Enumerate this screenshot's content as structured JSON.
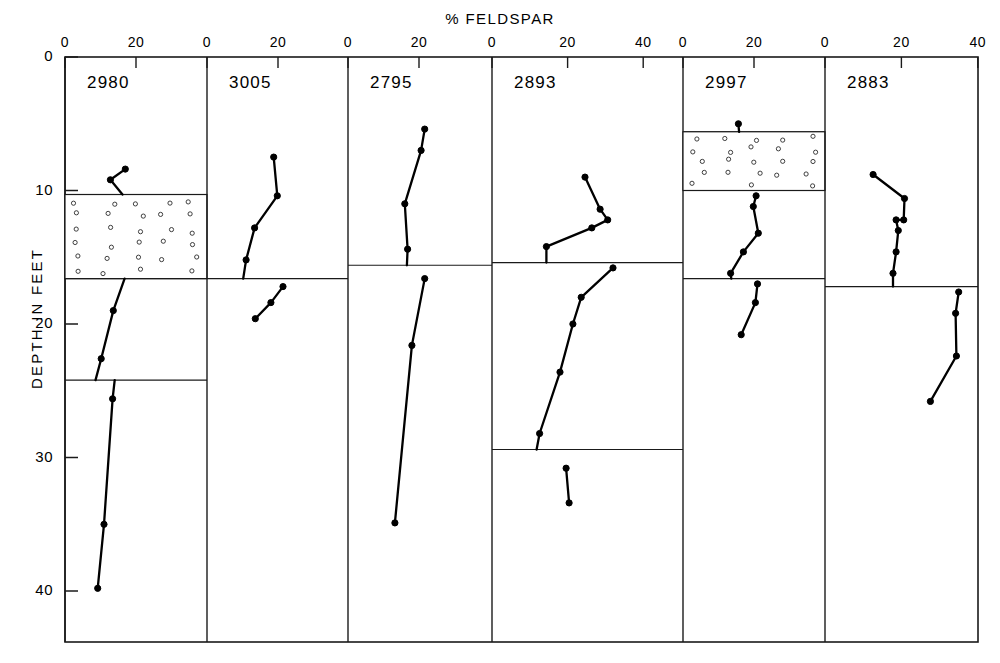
{
  "figure": {
    "title": "% FELDSPAR",
    "y_axis_label": "DEPTH IN FEET",
    "y_ticks": [
      "0",
      "10",
      "20",
      "30",
      "40"
    ],
    "line_color": "#000000",
    "axis_color": "#1a1a1a",
    "background": "#ffffff"
  },
  "chart_data": {
    "type": "line",
    "title": "% FELDSPAR",
    "xlabel": "% FELDSPAR",
    "ylabel": "DEPTH IN FEET",
    "ylim": [
      0,
      44
    ],
    "y_inverted": true,
    "grid": false,
    "legend": "none",
    "note": "Six stratigraphic borehole columns; x = percent feldspar, y = depth in feet (increasing downward). Stippled (small-circle) blocks denote a gravel/coarse lithologic interval; thin horizontal rules are bed-contact boundaries.",
    "panels": [
      {
        "name": "2980",
        "xlim": [
          0,
          30
        ],
        "x_ticks": [
          0,
          20
        ],
        "x_tick_labels": [
          "0",
          "20"
        ],
        "lithology_bands": [
          {
            "pattern": "circles",
            "top_depth": 10.3,
            "bottom_depth": 16.6
          }
        ],
        "boundaries": [
          10.3,
          16.6,
          24.2
        ],
        "series": [
          {
            "name": "upper",
            "points": [
              {
                "depth": 8.4,
                "value": 17.0
              },
              {
                "depth": 9.2,
                "value": 12.8
              },
              {
                "depth": 10.3,
                "value": 16.2
              }
            ]
          },
          {
            "name": "middle",
            "points": [
              {
                "depth": 16.6,
                "value": 16.8
              },
              {
                "depth": 19.0,
                "value": 13.6
              },
              {
                "depth": 22.6,
                "value": 10.2
              },
              {
                "depth": 24.2,
                "value": 8.6
              }
            ]
          },
          {
            "name": "lower",
            "points": [
              {
                "depth": 24.2,
                "value": 14.0
              },
              {
                "depth": 25.6,
                "value": 13.4
              },
              {
                "depth": 35.0,
                "value": 11.0
              },
              {
                "depth": 39.8,
                "value": 9.2
              }
            ]
          }
        ]
      },
      {
        "name": "3005",
        "xlim": [
          0,
          30
        ],
        "x_ticks": [
          0,
          20
        ],
        "x_tick_labels": [
          "0",
          "20"
        ],
        "lithology_bands": [],
        "boundaries": [
          16.6
        ],
        "series": [
          {
            "name": "upper",
            "points": [
              {
                "depth": 7.5,
                "value": 18.8
              },
              {
                "depth": 10.4,
                "value": 19.8
              },
              {
                "depth": 12.8,
                "value": 13.4
              },
              {
                "depth": 15.2,
                "value": 11.0
              },
              {
                "depth": 16.6,
                "value": 10.2
              }
            ]
          },
          {
            "name": "lower",
            "points": [
              {
                "depth": 17.2,
                "value": 21.4
              },
              {
                "depth": 18.4,
                "value": 18.0
              },
              {
                "depth": 19.6,
                "value": 13.6
              }
            ]
          }
        ]
      },
      {
        "name": "2795",
        "xlim": [
          0,
          30
        ],
        "x_ticks": [
          0,
          20
        ],
        "x_tick_labels": [
          "0",
          "20"
        ],
        "lithology_bands": [],
        "boundaries": [
          15.6
        ],
        "series": [
          {
            "name": "upper",
            "points": [
              {
                "depth": 5.4,
                "value": 21.6
              },
              {
                "depth": 7.0,
                "value": 20.6
              },
              {
                "depth": 11.0,
                "value": 16.0
              },
              {
                "depth": 14.4,
                "value": 16.8
              },
              {
                "depth": 15.6,
                "value": 16.6
              }
            ]
          },
          {
            "name": "lower",
            "points": [
              {
                "depth": 16.6,
                "value": 21.6
              },
              {
                "depth": 21.6,
                "value": 18.0
              },
              {
                "depth": 34.9,
                "value": 13.2
              }
            ]
          }
        ]
      },
      {
        "name": "2893",
        "xlim": [
          0,
          43
        ],
        "x_ticks": [
          0,
          20,
          40
        ],
        "x_tick_labels": [
          "0",
          "20",
          "40"
        ],
        "lithology_bands": [],
        "boundaries": [
          15.4,
          29.4
        ],
        "series": [
          {
            "name": "upper",
            "points": [
              {
                "depth": 9.0,
                "value": 24.6
              },
              {
                "depth": 11.4,
                "value": 28.6
              },
              {
                "depth": 12.2,
                "value": 30.6
              },
              {
                "depth": 12.8,
                "value": 26.4
              },
              {
                "depth": 14.2,
                "value": 14.4
              },
              {
                "depth": 15.4,
                "value": 14.4
              }
            ]
          },
          {
            "name": "lower",
            "points": [
              {
                "depth": 15.8,
                "value": 32.0
              },
              {
                "depth": 18.0,
                "value": 23.6
              },
              {
                "depth": 20.0,
                "value": 21.4
              },
              {
                "depth": 23.6,
                "value": 18.0
              },
              {
                "depth": 28.2,
                "value": 12.6
              },
              {
                "depth": 29.4,
                "value": 11.8
              }
            ]
          },
          {
            "name": "basal",
            "points": [
              {
                "depth": 30.8,
                "value": 19.6
              },
              {
                "depth": 33.4,
                "value": 20.4
              }
            ]
          }
        ]
      },
      {
        "name": "2997",
        "xlim": [
          0,
          30
        ],
        "x_ticks": [
          0,
          20
        ],
        "x_tick_labels": [
          "0",
          "20"
        ],
        "lithology_bands": [
          {
            "pattern": "circles",
            "top_depth": 5.6,
            "bottom_depth": 10.0
          }
        ],
        "boundaries": [
          5.6,
          10.0,
          16.6
        ],
        "series": [
          {
            "name": "top",
            "points": [
              {
                "depth": 5.0,
                "value": 15.6
              },
              {
                "depth": 5.6,
                "value": 15.8
              }
            ]
          },
          {
            "name": "middle",
            "points": [
              {
                "depth": 10.4,
                "value": 20.6
              },
              {
                "depth": 11.2,
                "value": 19.8
              },
              {
                "depth": 13.2,
                "value": 21.2
              },
              {
                "depth": 14.6,
                "value": 17.0
              },
              {
                "depth": 16.2,
                "value": 13.4
              },
              {
                "depth": 16.6,
                "value": 13.6
              }
            ]
          },
          {
            "name": "lower",
            "points": [
              {
                "depth": 17.0,
                "value": 21.0
              },
              {
                "depth": 18.4,
                "value": 20.4
              },
              {
                "depth": 20.8,
                "value": 16.4
              }
            ]
          }
        ]
      },
      {
        "name": "2883",
        "xlim": [
          0,
          43
        ],
        "x_ticks": [
          0,
          20,
          40
        ],
        "x_tick_labels": [
          "0",
          "20",
          "40"
        ],
        "lithology_bands": [],
        "boundaries": [
          17.2
        ],
        "series": [
          {
            "name": "upper",
            "points": [
              {
                "depth": 8.8,
                "value": 12.6
              },
              {
                "depth": 10.6,
                "value": 20.8
              },
              {
                "depth": 12.2,
                "value": 20.6
              },
              {
                "depth": 12.2,
                "value": 18.6
              },
              {
                "depth": 13.0,
                "value": 19.2
              },
              {
                "depth": 14.6,
                "value": 18.6
              },
              {
                "depth": 16.2,
                "value": 17.8
              },
              {
                "depth": 17.2,
                "value": 17.8
              }
            ]
          },
          {
            "name": "lower",
            "points": [
              {
                "depth": 17.6,
                "value": 35.0
              },
              {
                "depth": 19.2,
                "value": 34.2
              },
              {
                "depth": 22.4,
                "value": 34.4
              },
              {
                "depth": 25.8,
                "value": 27.6
              }
            ]
          }
        ]
      }
    ]
  }
}
